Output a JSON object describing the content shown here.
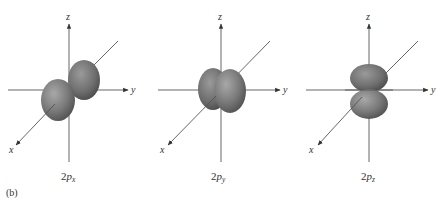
{
  "figure": {
    "panel_label": "(b)",
    "colors": {
      "lobe_light": "#9a9a9a",
      "lobe_mid": "#737373",
      "lobe_dark": "#4a4a4a",
      "axis": "#555555"
    },
    "panels": [
      {
        "id": "2px",
        "label_main": "2",
        "label_p": "p",
        "label_sub": "x",
        "axes": {
          "x": "x",
          "y": "y",
          "z": "z"
        }
      },
      {
        "id": "2py",
        "label_main": "2",
        "label_p": "p",
        "label_sub": "y",
        "axes": {
          "x": "x",
          "y": "y",
          "z": "z"
        }
      },
      {
        "id": "2pz",
        "label_main": "2",
        "label_p": "p",
        "label_sub": "z",
        "axes": {
          "x": "x",
          "y": "y",
          "z": "z"
        }
      }
    ]
  }
}
